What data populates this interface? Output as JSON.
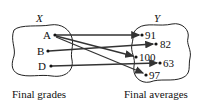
{
  "diagram": {
    "domain_set": {
      "name": "X",
      "caption": "Final grades",
      "elements": [
        "A",
        "B",
        "D"
      ]
    },
    "codomain_set": {
      "name": "Y",
      "caption": "Final averages",
      "elements": [
        "91",
        "82",
        "100",
        "63",
        "97"
      ]
    },
    "mappings": [
      {
        "from": "A",
        "to": "91"
      },
      {
        "from": "A",
        "to": "100"
      },
      {
        "from": "A",
        "to": "97"
      },
      {
        "from": "B",
        "to": "82"
      },
      {
        "from": "D",
        "to": "63"
      }
    ]
  }
}
